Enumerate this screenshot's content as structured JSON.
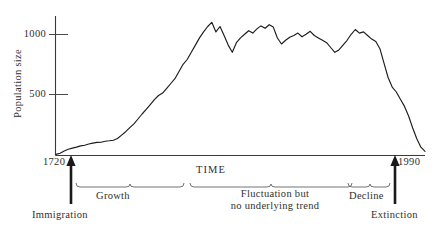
{
  "figure": {
    "ylabel": "Population size",
    "xlabel": "TIME",
    "year_start": "1720",
    "year_end": "1990",
    "tick_1000": "1000",
    "tick_500": "500",
    "phase_growth": "Growth",
    "phase_fluctuation": "Fluctuation but\nno underlying trend",
    "phase_decline": "Decline",
    "ann_immigration": "Immigration",
    "ann_extinction": "Extinction"
  },
  "chart_data": {
    "type": "line",
    "title": "",
    "xlabel": "TIME",
    "ylabel": "Population size",
    "xlim": [
      1720,
      1990
    ],
    "ylim": [
      0,
      1180
    ],
    "yticks": [
      500,
      1000
    ],
    "ytick_labels": [
      "500",
      "1000"
    ],
    "xticks": [
      1720,
      1990
    ],
    "xtick_labels": [
      "1720",
      "1990"
    ],
    "grid": false,
    "legend": "none",
    "line_color": "#1c1c1c",
    "annotations": [
      {
        "text": "Immigration",
        "x": 1720,
        "type": "up-arrow",
        "position": "below-axis-left"
      },
      {
        "text": "Extinction",
        "x": 1990,
        "type": "up-arrow",
        "position": "below-axis-right"
      }
    ],
    "phase_brackets": [
      {
        "label": "Growth",
        "x_start": 1722,
        "x_end": 1805
      },
      {
        "label": "Fluctuation but no underlying trend",
        "x_start": 1809,
        "x_end": 1931
      },
      {
        "label": "Decline",
        "x_start": 1935,
        "x_end": 1967
      }
    ],
    "x": [
      1720,
      1723,
      1726,
      1729,
      1732,
      1735,
      1738,
      1741,
      1744,
      1747,
      1750,
      1753,
      1756,
      1759,
      1762,
      1765,
      1768,
      1771,
      1774,
      1777,
      1780,
      1783,
      1786,
      1789,
      1792,
      1795,
      1798,
      1801,
      1804,
      1807,
      1810,
      1813,
      1816,
      1819,
      1822,
      1825,
      1828,
      1831,
      1834,
      1837,
      1840,
      1843,
      1846,
      1849,
      1852,
      1855,
      1858,
      1861,
      1864,
      1867,
      1870,
      1873,
      1876,
      1879,
      1882,
      1885,
      1888,
      1891,
      1894,
      1897,
      1900,
      1903,
      1906,
      1909,
      1912,
      1915,
      1918,
      1921,
      1924,
      1927,
      1930,
      1933,
      1936,
      1939,
      1942,
      1945,
      1948,
      1951,
      1954,
      1957,
      1960,
      1963,
      1966,
      1969,
      1972,
      1975,
      1978,
      1981,
      1984,
      1987,
      1990
    ],
    "values": [
      10,
      20,
      38,
      52,
      62,
      70,
      80,
      86,
      96,
      104,
      110,
      112,
      120,
      124,
      128,
      140,
      168,
      196,
      230,
      262,
      300,
      342,
      380,
      420,
      462,
      500,
      520,
      560,
      600,
      640,
      700,
      760,
      800,
      860,
      920,
      980,
      1030,
      1075,
      1110,
      1030,
      1075,
      1000,
      920,
      860,
      940,
      980,
      1010,
      1040,
      1020,
      1055,
      1080,
      1060,
      1090,
      1070,
      980,
      930,
      960,
      985,
      1000,
      1020,
      990,
      1010,
      1035,
      1000,
      980,
      960,
      940,
      900,
      860,
      880,
      920,
      960,
      1000,
      1040,
      1010,
      1020,
      990,
      960,
      940,
      880,
      760,
      640,
      560,
      500,
      440,
      380,
      300,
      200,
      110,
      40,
      5
    ]
  }
}
